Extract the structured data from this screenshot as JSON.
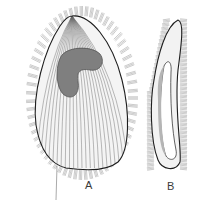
{
  "figure": {
    "panels": [
      {
        "id": "A",
        "label": "A",
        "view": "broad face view with kidney-shaped macronucleus"
      },
      {
        "id": "B",
        "label": "B",
        "view": "lateral view, curved slender body"
      }
    ],
    "colors": {
      "background": "#ffffff",
      "outline": "#1e1e1e",
      "ciliary_rows": "#5a5a5a",
      "cilia": "#7a7a7a",
      "macronucleus": "#7d7d7d"
    }
  }
}
